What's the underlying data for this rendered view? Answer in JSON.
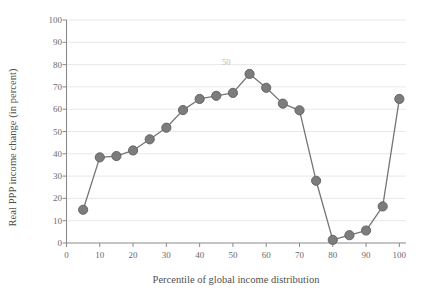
{
  "chart_data": {
    "type": "line",
    "title": "",
    "xlabel": "Percentile of global income distribution",
    "ylabel": "Real PPP income change (in percent)",
    "xlim": [
      0,
      102
    ],
    "ylim": [
      0,
      100
    ],
    "xticks": [
      "0",
      "10",
      "20",
      "30",
      "40",
      "50",
      "60",
      "70",
      "80",
      "90",
      "100"
    ],
    "xtick_values": [
      0,
      10,
      20,
      30,
      40,
      50,
      60,
      70,
      80,
      90,
      100
    ],
    "yticks": [
      "0",
      "10",
      "20",
      "30",
      "40",
      "50",
      "60",
      "70",
      "80",
      "90",
      "100"
    ],
    "ytick_values": [
      0,
      10,
      20,
      30,
      40,
      50,
      60,
      70,
      80,
      90,
      100
    ],
    "grid": "horizontal",
    "legend": "none",
    "x": [
      5,
      10,
      15,
      20,
      25,
      30,
      35,
      40,
      45,
      50,
      55,
      60,
      65,
      70,
      75,
      80,
      85,
      90,
      95,
      100
    ],
    "values": [
      14.9,
      38.4,
      39.0,
      41.5,
      46.5,
      51.7,
      59.6,
      64.6,
      66.0,
      67.3,
      75.8,
      69.6,
      62.5,
      59.5,
      27.9,
      1.4,
      3.5,
      5.6,
      16.4,
      64.6
    ],
    "series": [
      {
        "name": "Real PPP income change",
        "color": "#6e6e6e",
        "marker": "circle",
        "values": [
          14.9,
          38.4,
          39.0,
          41.5,
          46.5,
          51.7,
          59.6,
          64.6,
          66.0,
          67.3,
          75.8,
          69.6,
          62.5,
          59.5,
          27.9,
          1.4,
          3.5,
          5.6,
          16.4,
          64.6
        ]
      }
    ],
    "annotations": [
      {
        "text": "50",
        "x": 48,
        "y": 81
      }
    ],
    "colors": {
      "line": "#757575",
      "marker_fill": "#7c7c7c",
      "marker_stroke": "#5f5f5f",
      "grid": "#e8e8e8",
      "axis": "#8a8a8a",
      "text": "#5a5a5a"
    }
  }
}
